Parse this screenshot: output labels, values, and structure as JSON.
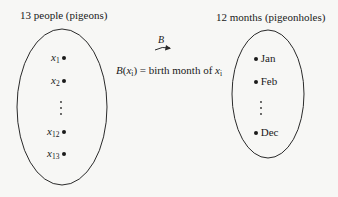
{
  "diagram": {
    "left_set": {
      "title": "13 people (pigeons)",
      "elements": [
        {
          "var": "x",
          "sub": "1"
        },
        {
          "var": "x",
          "sub": "2"
        },
        {
          "ellipsis": "⋮"
        },
        {
          "var": "x",
          "sub": "12"
        },
        {
          "var": "x",
          "sub": "13"
        }
      ]
    },
    "mapping": {
      "arrow_label": "B",
      "formula": {
        "fn": "B",
        "arg_var": "x",
        "arg_sub": "i",
        "equals_text": " = birth month of ",
        "rhs_var": "x",
        "rhs_sub": "i"
      }
    },
    "right_set": {
      "title": "12 months (pigeonholes)",
      "elements": [
        {
          "label": "Jan"
        },
        {
          "label": "Feb"
        },
        {
          "ellipsis": "⋮"
        },
        {
          "label": "Dec"
        }
      ]
    },
    "colors": {
      "stroke": "#2a2a2a",
      "background": "#f7f7f5"
    }
  }
}
